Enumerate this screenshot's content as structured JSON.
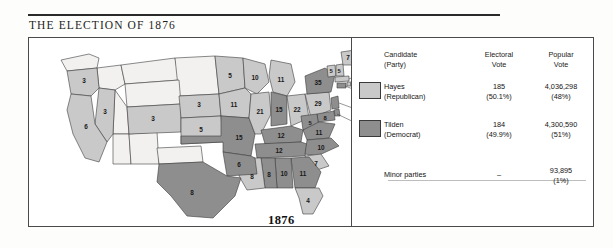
{
  "title": "THE ELECTION OF 1876",
  "date_badge": "1876",
  "legend": {
    "headers": {
      "candidate": "Candidate\n(Party)",
      "candidate_line1": "Candidate",
      "candidate_line2": "(Party)",
      "electoral_line1": "Electoral",
      "electoral_line2": "Vote",
      "popular_line1": "Popular",
      "popular_line2": "Vote"
    },
    "rows": [
      {
        "name_line1": "Hayes",
        "name_line2": "(Republican)",
        "electoral": "185",
        "electoral_pct": "(50.1%)",
        "popular": "4,036,298",
        "popular_pct": "(48%)",
        "color": "#c9c9c9"
      },
      {
        "name_line1": "Tilden",
        "name_line2": "(Democrat)",
        "electoral": "184",
        "electoral_pct": "(49.9%)",
        "popular": "4,300,590",
        "popular_pct": "(51%)",
        "color": "#8e8e8e"
      }
    ],
    "minor": {
      "name": "Minor parties",
      "electoral": "–",
      "popular": "93,895",
      "popular_pct": "(1%)"
    }
  },
  "map": {
    "colors": {
      "hayes": "#c9c9c9",
      "tilden": "#8e8e8e",
      "territory": "#f2f1ef",
      "border": "#3c3c3c"
    },
    "states": [
      {
        "code": "WA",
        "label": "",
        "party": "territory"
      },
      {
        "code": "OR",
        "label": "3",
        "party": "hayes"
      },
      {
        "code": "CA",
        "label": "6",
        "party": "hayes"
      },
      {
        "code": "NV",
        "label": "3",
        "party": "hayes"
      },
      {
        "code": "CO",
        "label": "3",
        "party": "hayes"
      },
      {
        "code": "NE",
        "label": "3",
        "party": "hayes"
      },
      {
        "code": "KS",
        "label": "5",
        "party": "hayes"
      },
      {
        "code": "MN",
        "label": "5",
        "party": "hayes"
      },
      {
        "code": "IA",
        "label": "11",
        "party": "hayes"
      },
      {
        "code": "WI",
        "label": "10",
        "party": "hayes"
      },
      {
        "code": "MI",
        "label": "11",
        "party": "hayes"
      },
      {
        "code": "IL",
        "label": "21",
        "party": "hayes"
      },
      {
        "code": "IN",
        "label": "15",
        "party": "tilden"
      },
      {
        "code": "OH",
        "label": "22",
        "party": "hayes"
      },
      {
        "code": "PA",
        "label": "29",
        "party": "hayes"
      },
      {
        "code": "NY",
        "label": "35",
        "party": "tilden"
      },
      {
        "code": "ME",
        "label": "7",
        "party": "hayes"
      },
      {
        "code": "VT",
        "label": "5",
        "party": "hayes"
      },
      {
        "code": "NH",
        "label": "5",
        "party": "hayes"
      },
      {
        "code": "MA",
        "label": "13",
        "party": "hayes"
      },
      {
        "code": "RI",
        "label": "4",
        "party": "hayes"
      },
      {
        "code": "CT",
        "label": "6",
        "party": "tilden"
      },
      {
        "code": "NJ",
        "label": "9",
        "party": "tilden"
      },
      {
        "code": "DE",
        "label": "3",
        "party": "tilden"
      },
      {
        "code": "MD",
        "label": "8",
        "party": "tilden"
      },
      {
        "code": "WV",
        "label": "5",
        "party": "tilden"
      },
      {
        "code": "VA",
        "label": "11",
        "party": "tilden"
      },
      {
        "code": "KY",
        "label": "12",
        "party": "tilden"
      },
      {
        "code": "TN",
        "label": "12",
        "party": "tilden"
      },
      {
        "code": "NC",
        "label": "10",
        "party": "tilden"
      },
      {
        "code": "SC",
        "label": "7",
        "party": "hayes"
      },
      {
        "code": "GA",
        "label": "11",
        "party": "tilden"
      },
      {
        "code": "AL",
        "label": "10",
        "party": "tilden"
      },
      {
        "code": "MS",
        "label": "8",
        "party": "tilden"
      },
      {
        "code": "FL",
        "label": "4",
        "party": "hayes"
      },
      {
        "code": "LA",
        "label": "8",
        "party": "hayes"
      },
      {
        "code": "AR",
        "label": "6",
        "party": "tilden"
      },
      {
        "code": "MO",
        "label": "15",
        "party": "tilden"
      },
      {
        "code": "TX",
        "label": "8",
        "party": "tilden"
      }
    ]
  }
}
